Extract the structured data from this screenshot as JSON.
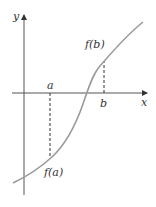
{
  "figure": {
    "axes": {
      "x_label": "x",
      "y_label": "y",
      "color": "#333333"
    },
    "points": {
      "a": {
        "label": "a",
        "value_label": "f(a)"
      },
      "b": {
        "label": "b",
        "value_label": "f(b)"
      }
    },
    "curve": {
      "color": "#9a9a9a",
      "shape": "increasing S-curve, negative at a, positive at b"
    },
    "dashed_lines": [
      {
        "from": "a",
        "to": "f(a)",
        "direction": "down"
      },
      {
        "from": "b",
        "to": "f(b)",
        "direction": "up"
      }
    ]
  },
  "labels": {
    "y_axis": "y",
    "x_axis": "x",
    "a": "a",
    "b": "b",
    "fa_f": "f",
    "fa_arg": "(a)",
    "fb_f": "f",
    "fb_arg": "(b)"
  }
}
